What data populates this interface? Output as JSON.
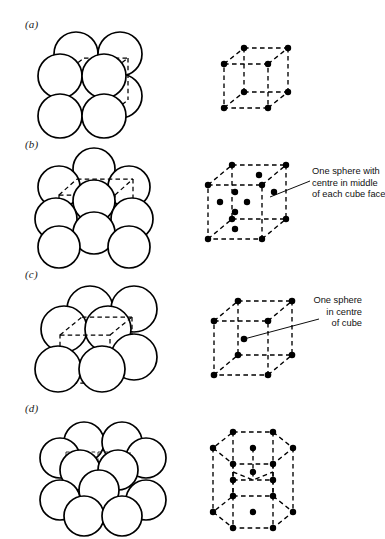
{
  "figure": {
    "background_color": "#ffffff",
    "line_color": "#000000",
    "panel_count": 4
  },
  "panels": [
    {
      "label": "(a)",
      "structure": "simple cubic",
      "packing_spheres": 8,
      "lattice_points": 8,
      "annotation": ""
    },
    {
      "label": "(b)",
      "structure": "face-centred cubic",
      "packing_spheres": 14,
      "lattice_points": 14,
      "annotation": "One sphere with\ncentre in middle\nof each cube face",
      "annotation_lines": [
        "One sphere with",
        "centre in middle",
        "of each cube face"
      ]
    },
    {
      "label": "(c)",
      "structure": "body-centred cubic",
      "packing_spheres": 9,
      "lattice_points": 9,
      "annotation": "One sphere\nin centre\nof cube",
      "annotation_lines": [
        "One sphere",
        "in centre",
        "of cube"
      ]
    },
    {
      "label": "(d)",
      "structure": "hexagonal close-packed",
      "packing_spheres": 17,
      "lattice_points": 17,
      "annotation": ""
    }
  ],
  "labels": {
    "a": "(a)",
    "b": "(b)",
    "c": "(c)",
    "d": "(d)"
  },
  "annotations": {
    "b_line1": "One sphere with",
    "b_line2": "centre in middle",
    "b_line3": "of each cube face",
    "c_line1": "One sphere",
    "c_line2": "in centre",
    "c_line3": "of cube"
  }
}
